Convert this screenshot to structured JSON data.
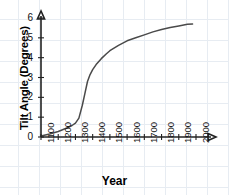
{
  "chart_data": {
    "type": "line",
    "title": "",
    "xlabel": "Year",
    "ylabel": "Tilt Angle (Degrees)",
    "xlim": [
      1100,
      2000
    ],
    "ylim": [
      0,
      6
    ],
    "grid": true,
    "legend": "none",
    "x_ticks": [
      "1100",
      "1200",
      "1300",
      "1400",
      "1500",
      "1600",
      "1700",
      "1800",
      "1900",
      "2000"
    ],
    "y_ticks": [
      "0",
      "1",
      "2",
      "3",
      "4",
      "5",
      "6"
    ],
    "series": [
      {
        "name": "Tilt Angle",
        "color": "#4a4a4a",
        "x": [
          1100,
          1150,
          1200,
          1250,
          1280,
          1300,
          1320,
          1340,
          1355,
          1370,
          1385,
          1400,
          1420,
          1450,
          1480,
          1500,
          1550,
          1600,
          1650,
          1700,
          1750,
          1800,
          1850,
          1900,
          1950,
          1980
        ],
        "y": [
          0.05,
          0.15,
          0.28,
          0.45,
          0.58,
          0.7,
          0.95,
          1.6,
          2.2,
          2.8,
          3.15,
          3.4,
          3.65,
          3.95,
          4.2,
          4.35,
          4.62,
          4.85,
          5.0,
          5.15,
          5.3,
          5.42,
          5.52,
          5.6,
          5.68,
          5.7
        ]
      }
    ]
  },
  "axis_colors": {
    "axis": "#222222",
    "grid": "#e7ecf2",
    "curve": "#4a4a4a"
  }
}
